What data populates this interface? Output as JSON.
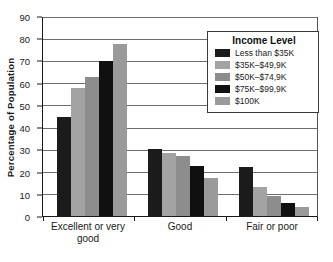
{
  "chart_data": {
    "type": "bar",
    "title": "",
    "xlabel": "",
    "ylabel": "Percentage of Population",
    "ylim": [
      0,
      90
    ],
    "yticks": [
      0,
      10,
      20,
      30,
      40,
      50,
      60,
      70,
      80,
      90
    ],
    "grid": true,
    "categories": [
      "Excellent or very good",
      "Good",
      "Fair or poor"
    ],
    "series": [
      {
        "name": "Less than $35K",
        "color": "#1b1b1b",
        "values": [
          45,
          30.5,
          22
        ]
      },
      {
        "name": "$35K–$49,9K",
        "color": "#a3a3a3",
        "values": [
          58,
          28.5,
          13
        ]
      },
      {
        "name": "$50K–$74,9K",
        "color": "#8d8d8d",
        "values": [
          63,
          27,
          9
        ]
      },
      {
        "name": "$75K–$99,9K",
        "color": "#101010",
        "values": [
          70,
          22.5,
          6
        ]
      },
      {
        "name": "$100K",
        "color": "#9a9a9a",
        "values": [
          78,
          17,
          4
        ]
      }
    ],
    "legend": {
      "title": "Income Level",
      "position": "top-right"
    }
  }
}
